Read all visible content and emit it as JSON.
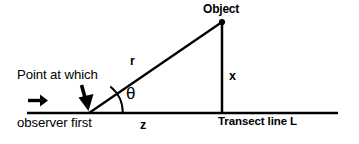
{
  "figure": {
    "type": "geometry-diagram",
    "background_color": "#ffffff",
    "stroke_color": "#000000",
    "width": 359,
    "height": 144
  },
  "labels": {
    "object": "Object",
    "radial_distance": "r",
    "angle": "θ",
    "perpendicular_distance": "x",
    "along_transect_distance": "z",
    "transect_line": "Transect line L",
    "annotation_line1": "Point at which",
    "annotation_line2": "observer first",
    "annotation_line3": "detects object"
  },
  "icons": {
    "observer_direction_arrow": "right-arrow-icon",
    "detection_point_arrow": "down-arrow-icon",
    "object_marker": "filled-dot-icon"
  },
  "geometry": {
    "transect_line": {
      "x1": 27,
      "y1": 113,
      "x2": 338,
      "y2": 113
    },
    "perpendicular_line": {
      "x1": 222,
      "y1": 22,
      "x2": 222,
      "y2": 113
    },
    "radial_line": {
      "x1": 89,
      "y1": 113,
      "x2": 222,
      "y2": 22
    },
    "angle_vertex": {
      "x": 89,
      "y": 113
    },
    "angle_arc_radius": 33,
    "object_point": {
      "x": 222,
      "y": 22
    },
    "observer_arrow": {
      "x1": 28,
      "y1": 101,
      "x2": 46,
      "y2": 101
    },
    "detection_arrow": {
      "x1": 83,
      "y1": 86,
      "x2": 88,
      "y2": 111
    }
  }
}
